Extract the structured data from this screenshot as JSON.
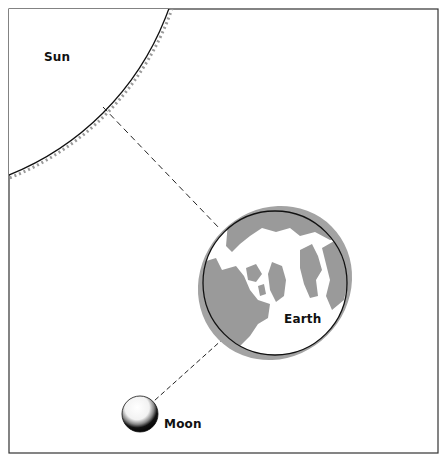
{
  "diagram": {
    "type": "astronomy-alignment",
    "bodies": [
      {
        "name": "Sun",
        "label": "Sun"
      },
      {
        "name": "Earth",
        "label": "Earth"
      },
      {
        "name": "Moon",
        "label": "Moon"
      }
    ],
    "labels": {
      "sun": "Sun",
      "earth": "Earth",
      "moon": "Moon"
    },
    "connectors": [
      {
        "from": "Sun",
        "to": "Earth",
        "style": "dashed"
      },
      {
        "from": "Earth",
        "to": "Moon",
        "style": "dashed"
      }
    ],
    "colors": {
      "land": "#9a9a9a",
      "earth_shadow": "#a3a3a3",
      "outline": "#1a1a1a",
      "frame": "#333333",
      "background": "#ffffff"
    }
  }
}
